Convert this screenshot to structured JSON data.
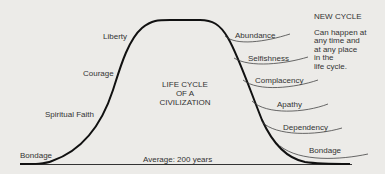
{
  "diagram": {
    "title_lines": [
      "LIFE CYCLE",
      "OF A",
      "CIVILIZATION"
    ],
    "axis_label": "Average: 200 years",
    "rising_stages": [
      "Bondage",
      "Spiritual Faith",
      "Courage",
      "Liberty"
    ],
    "falling_stages": [
      "Abundance",
      "Selfishness",
      "Complacency",
      "Apathy",
      "Dependency",
      "Bondage"
    ],
    "new_cycle": {
      "heading": "NEW CYCLE",
      "lines": [
        "Can happen at",
        "any time and",
        "at any place",
        "in the",
        "life cycle."
      ]
    },
    "colors": {
      "background": "#ecebe8",
      "curve": "#111111",
      "text": "#333333",
      "branch": "#444444"
    }
  }
}
